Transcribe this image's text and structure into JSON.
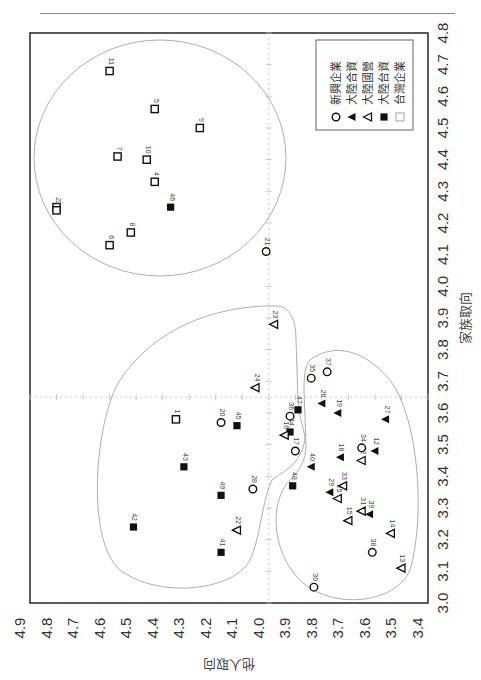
{
  "chart_data": {
    "type": "scatter",
    "orientation_note": "figure printed rotated 90 degrees clockwise",
    "xlabel": "家族取向",
    "ylabel": "他人取向",
    "xlim": [
      3.0,
      4.8
    ],
    "ylim": [
      3.4,
      4.9
    ],
    "x_ticks": [
      "3.0",
      "3.1",
      "3.2",
      "3.3",
      "3.4",
      "3.5",
      "3.6",
      "3.7",
      "3.8",
      "3.9",
      "4.0",
      "4.1",
      "4.2",
      "4.3",
      "4.4",
      "4.5",
      "4.6",
      "4.7",
      "4.8"
    ],
    "y_ticks": [
      "4.9",
      "4.8",
      "4.7",
      "4.6",
      "4.5",
      "4.4",
      "4.3",
      "4.2",
      "4.1",
      "4.0",
      "3.9",
      "3.8",
      "3.7",
      "3.6",
      "3.5",
      "3.4"
    ],
    "reference_lines": {
      "x": 3.65,
      "y": 4.0
    },
    "legend_position": "upper-right (rotated view)",
    "legend": [
      {
        "key": "tw",
        "label": "台灣企業",
        "marker": "open-square"
      },
      {
        "key": "cn_tw",
        "label": "大陸台資",
        "marker": "filled-square"
      },
      {
        "key": "cn_state",
        "label": "大陸國營",
        "marker": "open-triangle"
      },
      {
        "key": "cn_jv",
        "label": "大陸合資",
        "marker": "filled-triangle"
      },
      {
        "key": "new",
        "label": "新興企業",
        "marker": "open-circle"
      }
    ],
    "series": [
      {
        "name": "台灣企業",
        "points": [
          {
            "id": "1",
            "x": 3.58,
            "y": 4.35
          },
          {
            "id": "2",
            "x": 4.25,
            "y": 4.8
          },
          {
            "id": "3",
            "x": 4.24,
            "y": 4.8
          },
          {
            "id": "4",
            "x": 4.33,
            "y": 4.43
          },
          {
            "id": "5",
            "x": 4.56,
            "y": 4.43
          },
          {
            "id": "6",
            "x": 4.13,
            "y": 4.6
          },
          {
            "id": "7",
            "x": 4.41,
            "y": 4.57
          },
          {
            "id": "8",
            "x": 4.17,
            "y": 4.52
          },
          {
            "id": "9",
            "x": 4.5,
            "y": 4.26
          },
          {
            "id": "10",
            "x": 4.4,
            "y": 4.46
          },
          {
            "id": "11",
            "x": 4.68,
            "y": 4.6
          }
        ]
      },
      {
        "name": "大陸台資",
        "points": [
          {
            "id": "41",
            "x": 3.16,
            "y": 4.18
          },
          {
            "id": "42",
            "x": 3.24,
            "y": 4.51
          },
          {
            "id": "43",
            "x": 3.43,
            "y": 4.32
          },
          {
            "id": "44",
            "x": 3.54,
            "y": 3.92
          },
          {
            "id": "45",
            "x": 3.56,
            "y": 4.12
          },
          {
            "id": "46",
            "x": 4.25,
            "y": 4.37
          },
          {
            "id": "47",
            "x": 3.61,
            "y": 3.89
          },
          {
            "id": "48",
            "x": 3.37,
            "y": 3.91
          },
          {
            "id": "49",
            "x": 3.34,
            "y": 4.18
          }
        ]
      },
      {
        "name": "大陸國營",
        "points": [
          {
            "id": "13",
            "x": 3.11,
            "y": 3.5
          },
          {
            "id": "14",
            "x": 3.22,
            "y": 3.54
          },
          {
            "id": "15",
            "x": 3.26,
            "y": 3.7
          },
          {
            "id": "16",
            "x": 3.53,
            "y": 3.94
          },
          {
            "id": "22",
            "x": 3.23,
            "y": 4.12
          },
          {
            "id": "23",
            "x": 3.88,
            "y": 3.98
          },
          {
            "id": "24",
            "x": 3.68,
            "y": 4.05
          },
          {
            "id": "25",
            "x": 3.33,
            "y": 3.74
          },
          {
            "id": "31",
            "x": 3.29,
            "y": 3.65
          },
          {
            "id": "32",
            "x": 3.45,
            "y": 3.65
          },
          {
            "id": "33",
            "x": 3.37,
            "y": 3.72
          }
        ]
      },
      {
        "name": "大陸合資",
        "points": [
          {
            "id": "12",
            "x": 3.48,
            "y": 3.6
          },
          {
            "id": "18",
            "x": 3.46,
            "y": 3.73
          },
          {
            "id": "19",
            "x": 3.6,
            "y": 3.74
          },
          {
            "id": "26",
            "x": 3.63,
            "y": 3.8
          },
          {
            "id": "27",
            "x": 3.58,
            "y": 3.56
          },
          {
            "id": "29",
            "x": 3.35,
            "y": 3.77
          },
          {
            "id": "39",
            "x": 3.28,
            "y": 3.62
          },
          {
            "id": "40",
            "x": 3.43,
            "y": 3.84
          }
        ]
      },
      {
        "name": "新興企業",
        "points": [
          {
            "id": "17",
            "x": 3.48,
            "y": 3.9
          },
          {
            "id": "20",
            "x": 3.57,
            "y": 4.18
          },
          {
            "id": "21",
            "x": 4.11,
            "y": 4.01
          },
          {
            "id": "28",
            "x": 3.36,
            "y": 4.06
          },
          {
            "id": "30",
            "x": 3.05,
            "y": 3.83
          },
          {
            "id": "34",
            "x": 3.49,
            "y": 3.65
          },
          {
            "id": "35",
            "x": 3.71,
            "y": 3.84
          },
          {
            "id": "36",
            "x": 3.59,
            "y": 3.92
          },
          {
            "id": "37",
            "x": 3.73,
            "y": 3.78
          },
          {
            "id": "38",
            "x": 3.16,
            "y": 3.61
          }
        ]
      }
    ],
    "clusters": [
      {
        "name": "upper ellipse",
        "members": [
          "2",
          "3",
          "4",
          "5",
          "6",
          "7",
          "8",
          "9",
          "10",
          "11",
          "21",
          "46"
        ]
      },
      {
        "name": "left cluster",
        "members": [
          "1",
          "20",
          "22",
          "23",
          "24",
          "28",
          "41",
          "42",
          "43",
          "45",
          "49"
        ]
      },
      {
        "name": "right cluster",
        "members": [
          "12",
          "13",
          "14",
          "15",
          "16",
          "17",
          "18",
          "19",
          "25",
          "26",
          "27",
          "29",
          "30",
          "31",
          "32",
          "33",
          "34",
          "35",
          "36",
          "37",
          "38",
          "39",
          "40",
          "44",
          "47",
          "48"
        ]
      }
    ]
  }
}
